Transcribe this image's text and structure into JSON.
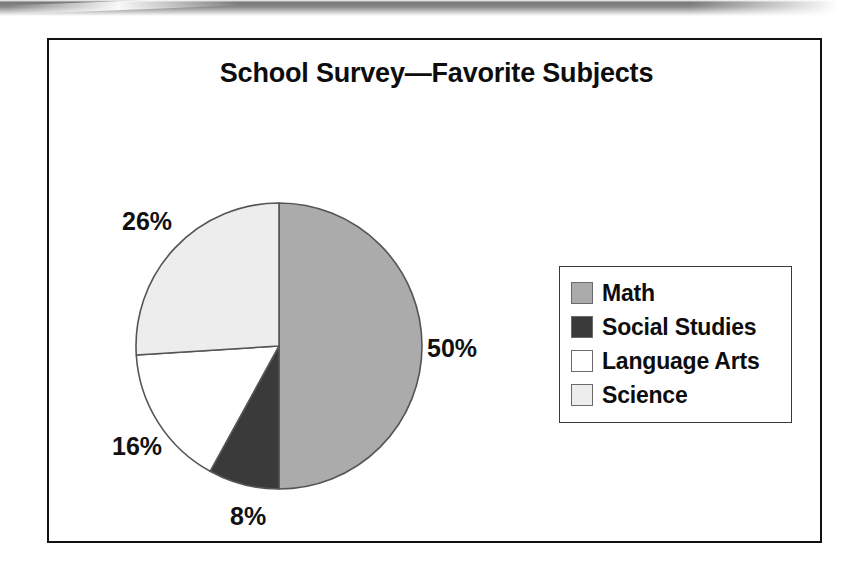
{
  "scan": {
    "band_color": "#4a4a4a",
    "page_background": "#ffffff"
  },
  "frame": {
    "border_color": "#111111"
  },
  "chart_data": {
    "type": "pie",
    "title": "School Survey—Favorite Subjects",
    "xlabel": "",
    "ylabel": "",
    "legend_position": "right",
    "grid": false,
    "start_angle_deg": 0,
    "direction": "clockwise",
    "categories": [
      "Math",
      "Social Studies",
      "Language Arts",
      "Science"
    ],
    "values": [
      50,
      8,
      16,
      26
    ],
    "value_unit": "%",
    "colors": [
      "#ababab",
      "#3a3a3a",
      "#ffffff",
      "#ededed"
    ],
    "slice_outline_color": "#555555",
    "slices": [
      {
        "label": "Math",
        "value": 50,
        "display": "50%",
        "color": "#ababab",
        "start_deg": 0,
        "end_deg": 180
      },
      {
        "label": "Social Studies",
        "value": 8,
        "display": "8%",
        "color": "#3a3a3a",
        "start_deg": 180,
        "end_deg": 208.8
      },
      {
        "label": "Language Arts",
        "value": 16,
        "display": "16%",
        "color": "#ffffff",
        "start_deg": 208.8,
        "end_deg": 266.4
      },
      {
        "label": "Science",
        "value": 26,
        "display": "26%",
        "color": "#ededed",
        "start_deg": 266.4,
        "end_deg": 360
      }
    ]
  },
  "pie_labels": {
    "math": "50%",
    "social_studies": "8%",
    "language_arts": "16%",
    "science": "26%"
  },
  "legend": {
    "items": [
      {
        "label": "Math",
        "color": "#ababab"
      },
      {
        "label": "Social Studies",
        "color": "#3a3a3a"
      },
      {
        "label": "Language Arts",
        "color": "#ffffff"
      },
      {
        "label": "Science",
        "color": "#ededed"
      }
    ]
  }
}
